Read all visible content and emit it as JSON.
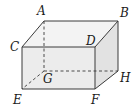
{
  "figure": {
    "type": "rectangular-prism",
    "vertices": [
      {
        "id": "A",
        "label": "A",
        "x": 44,
        "y": 21,
        "lx": 37,
        "ly": 15
      },
      {
        "id": "B",
        "label": "B",
        "x": 118,
        "y": 21,
        "lx": 120,
        "ly": 17
      },
      {
        "id": "C",
        "label": "C",
        "x": 22,
        "y": 47,
        "lx": 10,
        "ly": 51
      },
      {
        "id": "D",
        "label": "D",
        "x": 95,
        "y": 47,
        "lx": 86,
        "ly": 45
      },
      {
        "id": "G",
        "label": "G",
        "x": 44,
        "y": 71,
        "lx": 43,
        "ly": 83
      },
      {
        "id": "H",
        "label": "H",
        "x": 118,
        "y": 71,
        "lx": 120,
        "ly": 82
      },
      {
        "id": "E",
        "label": "E",
        "x": 22,
        "y": 89,
        "lx": 13,
        "ly": 104
      },
      {
        "id": "F",
        "label": "F",
        "x": 95,
        "y": 89,
        "lx": 91,
        "ly": 104
      }
    ],
    "colors": {
      "edge": "#3a3a3a",
      "hidden_edge": "#3a3a3a",
      "face_front": "#ececec",
      "face_top": "#f3f3f3",
      "face_side": "#e2e2e2"
    }
  }
}
